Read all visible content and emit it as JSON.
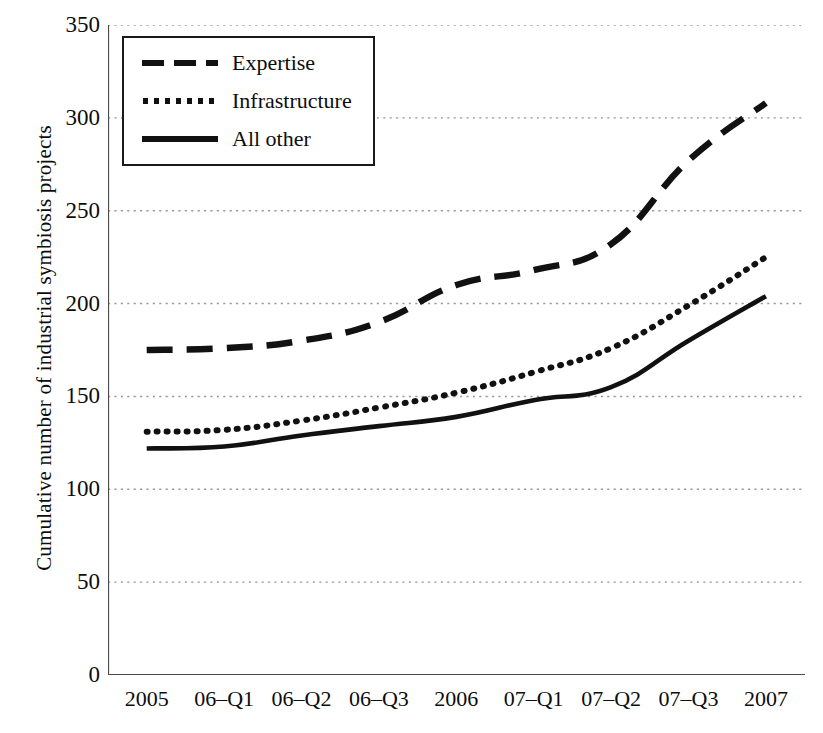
{
  "chart_data": {
    "type": "line",
    "title": "",
    "subtitle": "",
    "xlabel": "",
    "ylabel": "Cumulative number of industrial symbiosis projects",
    "categories": [
      "2005",
      "06–Q1",
      "06–Q2",
      "06–Q3",
      "2006",
      "07–Q1",
      "07–Q2",
      "07–Q3",
      "2007"
    ],
    "ylim": [
      0,
      350
    ],
    "yticks": [
      0,
      50,
      100,
      150,
      200,
      250,
      300,
      350
    ],
    "ytick_labels": [
      "0",
      "50",
      "100",
      "150",
      "200",
      "250",
      "300",
      "350"
    ],
    "grid": "horizontal-dotted",
    "legend_position": "upper-left-inside",
    "series": [
      {
        "name": "Expertise",
        "style": "dashed",
        "color": "#111111",
        "values": [
          175,
          176,
          180,
          190,
          210,
          218,
          232,
          277,
          308
        ]
      },
      {
        "name": "Infrastructure",
        "style": "dotted",
        "color": "#111111",
        "values": [
          131,
          132,
          137,
          144,
          152,
          163,
          176,
          199,
          225
        ]
      },
      {
        "name": "All other",
        "style": "solid",
        "color": "#111111",
        "values": [
          122,
          123,
          129,
          134,
          139,
          148,
          155,
          180,
          204
        ]
      }
    ]
  },
  "axes": {
    "y_title": "Cumulative number of industrial symbiosis projects"
  },
  "legend": {
    "entries": [
      {
        "label": "Expertise",
        "style": "dashed"
      },
      {
        "label": "Infrastructure",
        "style": "dotted"
      },
      {
        "label": "All other",
        "style": "solid"
      }
    ]
  },
  "colors": {
    "ink": "#111111",
    "grid": "#9a9a9a",
    "axis": "#4a4a4a",
    "background": "#ffffff"
  }
}
